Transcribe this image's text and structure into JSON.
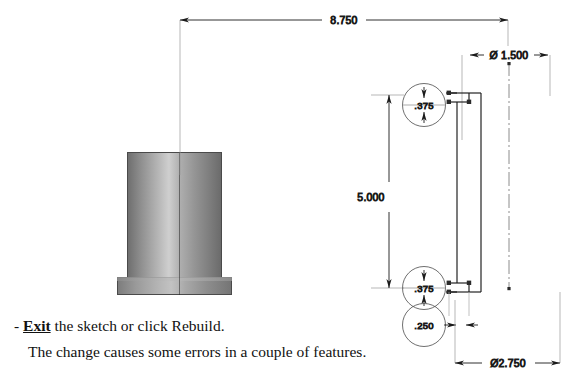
{
  "document": {
    "type": "cad-instruction-slide",
    "background_color": "#ffffff",
    "ink_color": "#1a1a1a"
  },
  "caption": {
    "lines": [
      {
        "id": "line-1",
        "prefix": "- ",
        "keyword": "Exit",
        "keyword_style": "bold-underline",
        "rest": " the sketch or click Rebuild.",
        "indent": false
      },
      {
        "id": "line-2",
        "prefix": "",
        "keyword": "",
        "keyword_style": "none",
        "rest": "The change causes some errors in a couple of features.",
        "indent": true
      }
    ]
  },
  "model_preview": {
    "name": "flanged-cylinder-part",
    "description": "shaded 3D revolved part: vertical cylinder with bottom flange",
    "body_color_light": "#cfcfcf",
    "body_color_dark": "#6b6b6b",
    "outline_color": "#4a4a4a"
  },
  "sketch": {
    "name": "revolve-profile-sketch",
    "description": "closed rectangular profile with endpoint handles",
    "line_color": "#1a1a1a",
    "endpoint_color": "#2b2b2b",
    "centerline_style": "dash-dot"
  },
  "dimensions": [
    {
      "id": "dim-overall-length",
      "value": "8.750",
      "orientation": "horizontal",
      "symbol": "",
      "label": "8.750",
      "arrows": "inward",
      "x_px": 344,
      "y_px": 17
    },
    {
      "id": "dim-inner-diameter",
      "value": "1.500",
      "orientation": "horizontal",
      "symbol": "Ø",
      "label": "Ø 1.500",
      "arrows": "outward",
      "x_px": 509,
      "y_px": 55
    },
    {
      "id": "dim-height",
      "value": "5.000",
      "orientation": "vertical",
      "symbol": "",
      "label": "5.000",
      "arrows": "inward",
      "x_px": 371,
      "y_px": 197
    },
    {
      "id": "dim-wall-top",
      "value": ".375",
      "orientation": "vertical",
      "symbol": "",
      "label": ".375",
      "arrows": "inward",
      "balloon": true,
      "x_px": 424,
      "y_px": 105
    },
    {
      "id": "dim-wall-bottom",
      "value": ".375",
      "orientation": "vertical",
      "symbol": "",
      "label": ".375",
      "arrows": "inward",
      "balloon": true,
      "x_px": 424,
      "y_px": 288
    },
    {
      "id": "dim-flange-thickness",
      "value": ".250",
      "orientation": "horizontal",
      "symbol": "",
      "label": ".250",
      "arrows": "outward",
      "balloon": true,
      "x_px": 424,
      "y_px": 325
    },
    {
      "id": "dim-outer-diameter",
      "value": "2.750",
      "orientation": "horizontal",
      "symbol": "Ø",
      "label": "Ø2.750",
      "arrows": "inward",
      "x_px": 508,
      "y_px": 363
    }
  ]
}
